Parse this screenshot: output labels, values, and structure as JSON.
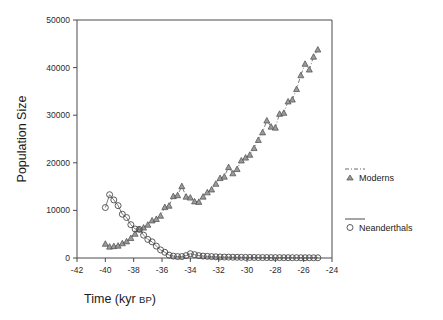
{
  "chart_data": {
    "type": "line",
    "title": "",
    "xlabel": "Time (kyr BP)",
    "xlabel_main": "Time (kyr ",
    "xlabel_small": "BP",
    "xlabel_close": ")",
    "ylabel": "Population Size",
    "xlim": [
      -42,
      -24
    ],
    "ylim": [
      0,
      50000
    ],
    "xticks": [
      -42,
      -40,
      -38,
      -36,
      -34,
      -32,
      -30,
      -28,
      -26,
      -24
    ],
    "xticklabels": [
      "-42",
      "-40",
      "-38",
      "-36",
      "-34",
      "-32",
      "-30",
      "-28",
      "-26",
      "-24"
    ],
    "yticks": [
      0,
      10000,
      20000,
      30000,
      40000,
      50000
    ],
    "yticklabels": [
      "0",
      "10000",
      "20000",
      "30000",
      "40000",
      "50000"
    ],
    "grid": false,
    "legend_position": "right",
    "series": [
      {
        "name": "Moderns",
        "marker": "triangle",
        "linestyle": "dash-dot",
        "color": "#6b6b6b",
        "x": [
          -40.0,
          -39.7,
          -39.4,
          -39.1,
          -38.8,
          -38.5,
          -38.2,
          -37.9,
          -37.6,
          -37.3,
          -37.0,
          -36.7,
          -36.4,
          -36.1,
          -35.8,
          -35.5,
          -35.2,
          -34.9,
          -34.6,
          -34.3,
          -34.0,
          -33.7,
          -33.4,
          -33.1,
          -32.8,
          -32.5,
          -32.2,
          -31.9,
          -31.6,
          -31.3,
          -31.0,
          -30.7,
          -30.4,
          -30.1,
          -29.8,
          -29.5,
          -29.2,
          -28.9,
          -28.6,
          -28.3,
          -28.0,
          -27.7,
          -27.4,
          -27.1,
          -26.8,
          -26.5,
          -26.2,
          -25.9,
          -25.6,
          -25.3,
          -25.0
        ],
        "values": [
          3000,
          2400,
          2500,
          2600,
          3100,
          3500,
          4200,
          5100,
          6100,
          6400,
          7000,
          7900,
          8200,
          8900,
          10700,
          11000,
          13000,
          13200,
          15100,
          12900,
          12700,
          11900,
          11800,
          12900,
          13800,
          14400,
          15600,
          16800,
          17100,
          19100,
          17800,
          18700,
          20500,
          21100,
          21700,
          23100,
          24800,
          26400,
          28900,
          27600,
          27400,
          30300,
          30500,
          32900,
          33300,
          35500,
          38400,
          40800,
          39600,
          42300,
          43800
        ]
      },
      {
        "name": "Neanderthals",
        "marker": "circle",
        "linestyle": "solid",
        "color": "#4a4a4a",
        "x": [
          -40.0,
          -39.7,
          -39.4,
          -39.1,
          -38.8,
          -38.5,
          -38.2,
          -37.9,
          -37.6,
          -37.3,
          -37.0,
          -36.7,
          -36.4,
          -36.1,
          -35.8,
          -35.5,
          -35.2,
          -34.9,
          -34.6,
          -34.3,
          -34.0,
          -33.7,
          -33.4,
          -33.1,
          -32.8,
          -32.5,
          -32.2,
          -31.9,
          -31.6,
          -31.3,
          -31.0,
          -30.7,
          -30.4,
          -30.1,
          -29.8,
          -29.5,
          -29.2,
          -28.9,
          -28.6,
          -28.3,
          -28.0,
          -27.7,
          -27.4,
          -27.1,
          -26.8,
          -26.5,
          -26.2,
          -25.9,
          -25.6,
          -25.3,
          -25.0
        ],
        "values": [
          10600,
          13300,
          12200,
          11000,
          9200,
          8500,
          7000,
          6100,
          6000,
          4800,
          3900,
          3400,
          2500,
          1700,
          1200,
          600,
          400,
          300,
          300,
          500,
          900,
          700,
          500,
          400,
          350,
          300,
          250,
          220,
          200,
          180,
          160,
          150,
          140,
          130,
          120,
          110,
          100,
          95,
          90,
          85,
          80,
          75,
          70,
          68,
          65,
          62,
          60,
          58,
          55,
          52,
          50
        ]
      }
    ],
    "legend": [
      {
        "label": "Moderns",
        "marker": "triangle",
        "linestyle": "dash-dot"
      },
      {
        "label": "Neanderthals",
        "marker": "circle",
        "linestyle": "solid"
      }
    ]
  }
}
